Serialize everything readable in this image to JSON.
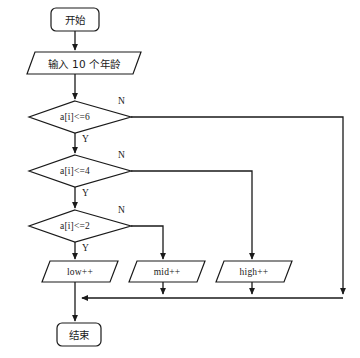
{
  "diagram": {
    "stroke_color": "#1a1a1a",
    "fill_color": "#ffffff",
    "background": "#ffffff",
    "nodes": [
      {
        "id": "start",
        "shape": "terminator",
        "text": "开始"
      },
      {
        "id": "input",
        "shape": "parallelogram",
        "text": "输入 10 个年龄"
      },
      {
        "id": "cond1",
        "shape": "diamond",
        "text": "a[i]<=6"
      },
      {
        "id": "cond2",
        "shape": "diamond",
        "text": "a[i]<=4"
      },
      {
        "id": "cond3",
        "shape": "diamond",
        "text": "a[i]<=2"
      },
      {
        "id": "low",
        "shape": "parallelogram",
        "text": "low++"
      },
      {
        "id": "mid",
        "shape": "parallelogram",
        "text": "mid++"
      },
      {
        "id": "high",
        "shape": "parallelogram",
        "text": "high++"
      },
      {
        "id": "end",
        "shape": "terminator",
        "text": "结束"
      }
    ],
    "edge_labels": {
      "cond1_no": "N",
      "cond1_yes": "Y",
      "cond2_no": "N",
      "cond2_yes": "Y",
      "cond3_no": "N",
      "cond3_yes": "Y"
    }
  }
}
